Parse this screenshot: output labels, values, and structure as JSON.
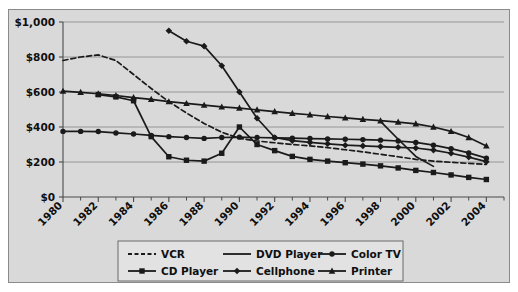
{
  "figure": {
    "background_color": "#ffffff",
    "panel_color": "#d9d9d9",
    "panel_border_color": "#8a8a8a",
    "line_color": "#1a1a1a",
    "grid_color": "#8f8f8f",
    "axis_color": "#4a4a4a"
  },
  "chart_data": {
    "type": "line",
    "title": "",
    "subtitle": "",
    "xlabel": "",
    "ylabel": "",
    "xlim": [
      1980,
      2005
    ],
    "ylim": [
      0,
      1000
    ],
    "grid": true,
    "grid_axis": "y",
    "legend_position": "bottom",
    "y_ticks": [
      0,
      200,
      400,
      600,
      800,
      1000
    ],
    "y_tick_labels": [
      "$0",
      "$200",
      "$400",
      "$600",
      "$800",
      "$1,000"
    ],
    "x_ticks": [
      1980,
      1982,
      1984,
      1986,
      1988,
      1990,
      1992,
      1994,
      1996,
      1998,
      2000,
      2002,
      2004
    ],
    "x_tick_labels": [
      "1980",
      "1982",
      "1984",
      "1986",
      "1988",
      "1990",
      "1992",
      "1994",
      "1996",
      "1998",
      "2000",
      "2002",
      "2004"
    ],
    "x_minor_ticks": [
      1981,
      1983,
      1985,
      1987,
      1989,
      1991,
      1993,
      1995,
      1997,
      1999,
      2001,
      2003,
      2005
    ],
    "x_tick_label_rotation": 45,
    "series": [
      {
        "name": "VCR",
        "marker": "none",
        "line_style": "dashed",
        "x": [
          1980,
          1981,
          1982,
          1983,
          1984,
          1985,
          1986,
          1987,
          1988,
          1989,
          1990,
          1991,
          1992,
          1993,
          1994,
          1995,
          1996,
          1997,
          1998,
          1999,
          2000,
          2001,
          2002,
          2003,
          2004
        ],
        "y": [
          780,
          800,
          812,
          780,
          700,
          620,
          545,
          480,
          420,
          370,
          335,
          320,
          310,
          300,
          292,
          282,
          270,
          258,
          244,
          230,
          215,
          205,
          198,
          192,
          186
        ]
      },
      {
        "name": "DVD Player",
        "marker": "none",
        "line_style": "solid",
        "x": [
          1998,
          1999,
          2000,
          2001
        ],
        "y": [
          432,
          330,
          232,
          175
        ]
      },
      {
        "name": "Color TV",
        "marker": "circle",
        "line_style": "solid",
        "x": [
          1980,
          1981,
          1982,
          1983,
          1984,
          1985,
          1986,
          1987,
          1988,
          1989,
          1990,
          1991,
          1992,
          1993,
          1994,
          1995,
          1996,
          1997,
          1998,
          1999,
          2000,
          2001,
          2002,
          2003,
          2004
        ],
        "y": [
          375,
          375,
          374,
          366,
          360,
          352,
          345,
          340,
          335,
          340,
          342,
          340,
          338,
          336,
          334,
          332,
          330,
          328,
          325,
          320,
          312,
          296,
          276,
          252,
          222
        ]
      },
      {
        "name": "CD Player",
        "marker": "square",
        "line_style": "solid",
        "x": [
          1982,
          1983,
          1984,
          1985,
          1986,
          1987,
          1988,
          1989,
          1990,
          1991,
          1992,
          1993,
          1994,
          1995,
          1996,
          1997,
          1998,
          1999,
          2000,
          2001,
          2002,
          2003,
          2004
        ],
        "y": [
          585,
          572,
          550,
          345,
          230,
          210,
          205,
          250,
          400,
          300,
          265,
          232,
          215,
          205,
          196,
          188,
          178,
          166,
          152,
          140,
          126,
          112,
          100
        ]
      },
      {
        "name": "Cellphone",
        "marker": "diamond",
        "line_style": "solid",
        "x": [
          1986,
          1987,
          1988,
          1989,
          1990,
          1991,
          1992,
          1993,
          1994,
          1995,
          1996,
          1997,
          1998,
          1999,
          2000,
          2001,
          2002,
          2003,
          2004
        ],
        "y": [
          950,
          890,
          862,
          750,
          600,
          450,
          340,
          322,
          312,
          304,
          296,
          292,
          288,
          284,
          280,
          268,
          250,
          228,
          202
        ]
      },
      {
        "name": "Printer",
        "marker": "triangle",
        "line_style": "solid",
        "x": [
          1980,
          1981,
          1982,
          1983,
          1984,
          1985,
          1986,
          1987,
          1988,
          1989,
          1990,
          1991,
          1992,
          1993,
          1994,
          1995,
          1996,
          1997,
          1998,
          1999,
          2000,
          2001,
          2002,
          2003,
          2004
        ],
        "y": [
          605,
          598,
          590,
          580,
          568,
          558,
          545,
          535,
          525,
          515,
          508,
          498,
          488,
          478,
          470,
          460,
          452,
          444,
          436,
          428,
          418,
          400,
          375,
          340,
          292
        ]
      }
    ],
    "legend": [
      {
        "label": "VCR",
        "marker": "none",
        "line_style": "dashed"
      },
      {
        "label": "DVD Player",
        "marker": "none",
        "line_style": "solid"
      },
      {
        "label": "Color TV",
        "marker": "circle",
        "line_style": "solid"
      },
      {
        "label": "CD Player",
        "marker": "square",
        "line_style": "solid"
      },
      {
        "label": "Cellphone",
        "marker": "diamond",
        "line_style": "solid"
      },
      {
        "label": "Printer",
        "marker": "triangle",
        "line_style": "solid"
      }
    ]
  }
}
